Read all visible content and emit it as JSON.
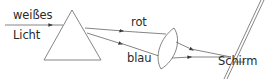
{
  "diagram": {
    "labels": {
      "input_line1": "weißes",
      "input_line2": "Licht",
      "ray_red": "rot",
      "ray_blue": "blau",
      "screen": "Schirm"
    },
    "elements": [
      "incident-ray",
      "prism",
      "red-ray",
      "blue-ray",
      "converging-lens",
      "screen"
    ],
    "colors": {
      "stroke": "#555555",
      "text": "#2a2a2a",
      "background": "#ffffff"
    }
  }
}
